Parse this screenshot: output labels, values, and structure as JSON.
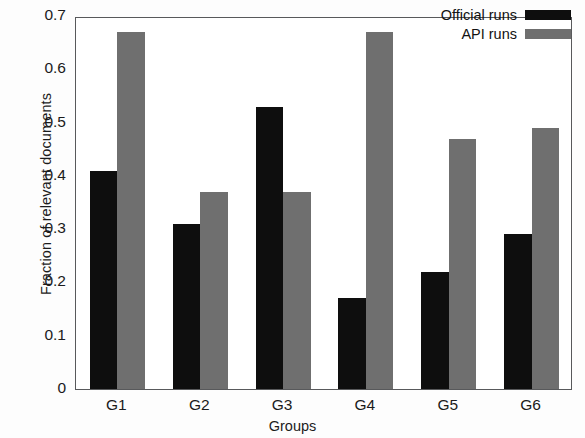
{
  "chart_data": {
    "type": "bar",
    "title": "",
    "xlabel": "Groups",
    "ylabel": "Fraction of relevant documents",
    "categories": [
      "G1",
      "G2",
      "G3",
      "G4",
      "G5",
      "G6"
    ],
    "series": [
      {
        "name": "Official runs",
        "color": "#0e0e0e",
        "values": [
          0.41,
          0.31,
          0.53,
          0.17,
          0.22,
          0.29
        ]
      },
      {
        "name": "API runs",
        "color": "#6f6f6f",
        "values": [
          0.67,
          0.37,
          0.37,
          0.67,
          0.47,
          0.49
        ]
      }
    ],
    "ylim": [
      0,
      0.7
    ],
    "ytick_labels": [
      "0",
      "0.1",
      "0.2",
      "0.3",
      "0.4",
      "0.5",
      "0.6",
      "0.7"
    ],
    "ytick_values": [
      0,
      0.1,
      0.2,
      0.3,
      0.4,
      0.5,
      0.6,
      0.7
    ],
    "grid": false,
    "legend_position": "top-right",
    "legend_entries": [
      "Official runs",
      "API runs"
    ]
  },
  "axes": {
    "frame_color": "#58595b",
    "background": "#ffffff"
  }
}
